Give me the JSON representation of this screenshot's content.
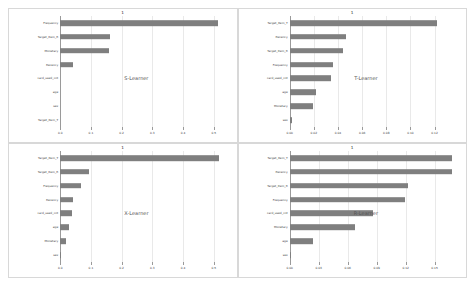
{
  "figure": {
    "background": "#ffffff",
    "bar_color": "#7f7f7f",
    "grid_color": "#e9e9e9",
    "axis_color": "#9a9a9a"
  },
  "chart_data": [
    {
      "type": "bar",
      "orientation": "horizontal",
      "title": "1",
      "annotation": "S-Learner",
      "xlabel": "",
      "ylabel": "",
      "grid": true,
      "xlim": [
        0.0,
        0.55
      ],
      "xticks": [
        0.0,
        0.1,
        0.2,
        0.3,
        0.4,
        0.5
      ],
      "xtick_labels": [
        "0.0",
        "0.1",
        "0.2",
        "0.3",
        "0.4",
        "0.5"
      ],
      "categories": [
        "Frequency",
        "Target_Item_R",
        "Monetary",
        "Recency",
        "card_used_cnt",
        "age",
        "sex",
        "Target_Item_T"
      ],
      "values": [
        0.513,
        0.162,
        0.158,
        0.041,
        0.0,
        0.0,
        0.0,
        0.0
      ]
    },
    {
      "type": "bar",
      "orientation": "horizontal",
      "title": "1",
      "annotation": "T-Learner",
      "xlabel": "",
      "ylabel": "",
      "grid": true,
      "xlim": [
        0.0,
        0.14
      ],
      "xticks": [
        0.0,
        0.02,
        0.04,
        0.06,
        0.08,
        0.1,
        0.12
      ],
      "xtick_labels": [
        "0.00",
        "0.02",
        "0.04",
        "0.06",
        "0.08",
        "0.10",
        "0.12"
      ],
      "categories": [
        "Target_Item_T",
        "Recency",
        "Target_Item_R",
        "Frequency",
        "card_used_cnt",
        "age",
        "Monetary",
        "sex"
      ],
      "values": [
        0.122,
        0.047,
        0.044,
        0.036,
        0.034,
        0.022,
        0.019,
        0.002
      ]
    },
    {
      "type": "bar",
      "orientation": "horizontal",
      "title": "1",
      "annotation": "X-Learner",
      "xlabel": "",
      "ylabel": "",
      "grid": true,
      "xlim": [
        0.0,
        0.55
      ],
      "xticks": [
        0.0,
        0.1,
        0.2,
        0.3,
        0.4,
        0.5
      ],
      "xtick_labels": [
        "0.0",
        "0.1",
        "0.2",
        "0.3",
        "0.4",
        "0.5"
      ],
      "categories": [
        "Target_Item_T",
        "Target_Item_R",
        "Frequency",
        "Recency",
        "card_used_cnt",
        "age",
        "Monetary",
        "sex"
      ],
      "values": [
        0.516,
        0.094,
        0.069,
        0.043,
        0.037,
        0.029,
        0.018,
        0.002
      ]
    },
    {
      "type": "bar",
      "orientation": "horizontal",
      "title": "1",
      "annotation": "R-Learner",
      "xlabel": "",
      "ylabel": "",
      "grid": true,
      "xlim": [
        0.0,
        0.175
      ],
      "xticks": [
        0.0,
        0.03,
        0.06,
        0.09,
        0.12,
        0.15
      ],
      "xtick_labels": [
        "0.00",
        "0.03",
        "0.06",
        "0.09",
        "0.12",
        "0.15"
      ],
      "categories": [
        "Target_Item_T",
        "Recency",
        "Target_Item_R",
        "Frequency",
        "card_used_cnt",
        "Monetary",
        "age",
        "sex"
      ],
      "values": [
        0.168,
        0.168,
        0.122,
        0.119,
        0.086,
        0.068,
        0.024,
        0.001
      ]
    }
  ]
}
